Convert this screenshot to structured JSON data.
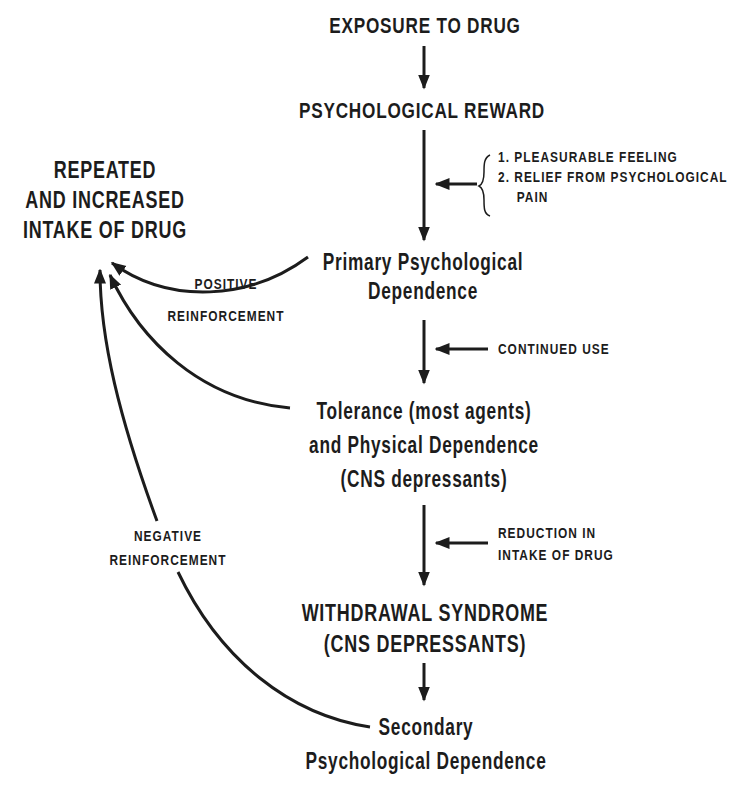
{
  "diagram": {
    "title_node": "EXPOSURE TO DRUG",
    "reward_node": "PSYCHOLOGICAL REWARD",
    "reward_reasons": {
      "item1": "1. PLEASURABLE FEELING",
      "item2_line1": "2. RELIEF FROM PSYCHOLOGICAL",
      "item2_line2": "PAIN"
    },
    "intake_node": {
      "line1": "REPEATED",
      "line2": "AND INCREASED",
      "line3": "INTAKE OF DRUG"
    },
    "primary_node": {
      "line1": "Primary Psychological",
      "line2": "Dependence"
    },
    "positive_label": {
      "line1": "POSITIVE",
      "line2": "REINFORCEMENT"
    },
    "continued_use": "CONTINUED USE",
    "tolerance_node": {
      "line1": "Tolerance (most agents)",
      "line2": "and Physical Dependence",
      "line3": "(CNS depressants)"
    },
    "reduction_label": {
      "line1": "REDUCTION IN",
      "line2": "INTAKE OF DRUG"
    },
    "withdrawal_node": {
      "line1": "WITHDRAWAL SYNDROME",
      "line2": "(CNS DEPRESSANTS)"
    },
    "negative_label": {
      "line1": "NEGATIVE",
      "line2": "REINFORCEMENT"
    },
    "secondary_node": {
      "line1": "Secondary",
      "line2": "Psychological Dependence"
    },
    "colors": {
      "ink": "#1c1c1c",
      "background": "#ffffff"
    }
  }
}
